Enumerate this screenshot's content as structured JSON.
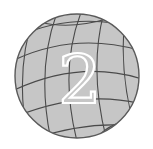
{
  "icon": {
    "name": "globe-icon",
    "numeral": "2",
    "colors": {
      "background": "#ffffff",
      "globe_fill": "#c6c6c6",
      "grid_line": "#4a4a4a",
      "outline": "#5a5a5a",
      "numeral_fill": "#c6c6c6",
      "numeral_stroke": "#ffffff"
    }
  }
}
